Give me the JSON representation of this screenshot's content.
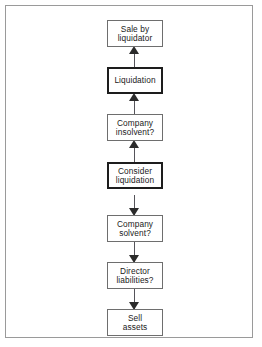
{
  "figure": {
    "type": "flowchart",
    "orientation": "vertical",
    "frame_border_color": "#9a9a9a",
    "background_color": "#ffffff",
    "box_border_color": "#6e6e6e",
    "emphasis_border_color": "#1d1d1d",
    "connector_color": "#55545a",
    "arrow_color": "#2b2b2b"
  },
  "nodes": [
    {
      "id": "sale-by-liquidator",
      "line1": "Sale by",
      "line2": "liquidator",
      "emphasis": false
    },
    {
      "id": "liquidation",
      "line1": "Liquidation",
      "line2": "",
      "emphasis": true
    },
    {
      "id": "company-insolvent",
      "line1": "Company",
      "line2": "insolvent?",
      "emphasis": false
    },
    {
      "id": "consider-liquidation",
      "line1": "Consider",
      "line2": "liquidation",
      "emphasis": true
    },
    {
      "id": "company-solvent",
      "line1": "Company",
      "line2": "solvent?",
      "emphasis": false
    },
    {
      "id": "director-liabilities",
      "line1": "Director",
      "line2": "liabilities?",
      "emphasis": false
    },
    {
      "id": "sell-assets",
      "line1": "Sell",
      "line2": "assets",
      "emphasis": false
    }
  ],
  "edges": [
    {
      "id": "edge-liquidation-to-sale",
      "from": "liquidation",
      "to": "sale-by-liquidator",
      "direction": "up"
    },
    {
      "id": "edge-insolvent-to-liquidation",
      "from": "company-insolvent",
      "to": "liquidation",
      "direction": "up"
    },
    {
      "id": "edge-consider-to-insolvent",
      "from": "consider-liquidation",
      "to": "company-insolvent",
      "direction": "up"
    },
    {
      "id": "edge-consider-to-solvent",
      "from": "consider-liquidation",
      "to": "company-solvent",
      "direction": "down"
    },
    {
      "id": "edge-solvent-to-director",
      "from": "company-solvent",
      "to": "director-liabilities",
      "direction": "down"
    },
    {
      "id": "edge-director-to-sell",
      "from": "director-liabilities",
      "to": "sell-assets",
      "direction": "down"
    }
  ]
}
